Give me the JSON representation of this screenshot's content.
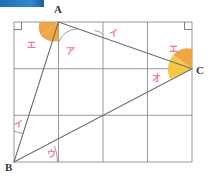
{
  "figure": {
    "type": "geometry-diagram",
    "canvas": {
      "width": 208,
      "height": 179,
      "background": "#ffffff"
    },
    "colors": {
      "grid_line": "#8c8c8c",
      "triangle_line": "#6e6e6e",
      "angle_fill_dark": "#eda13c",
      "angle_fill_light": "#f3c53f",
      "label_pink": "#f2788f",
      "point_label": "#3a3a3a",
      "accent_bar_start": "#1f6fb5",
      "accent_bar_end": "#2f86cf"
    },
    "rect": {
      "x0": 14,
      "y0": 22,
      "x1": 192,
      "y1": 162
    },
    "grid": {
      "columns": 4,
      "rows": 3,
      "x_lines": [
        14,
        58.5,
        103,
        147.5,
        192
      ],
      "y_lines": [
        22,
        68.7,
        115.3,
        162
      ]
    },
    "points": [
      {
        "name": "A",
        "x": 58.5,
        "y": 22,
        "label": "A",
        "label_x": 58,
        "label_y": 13
      },
      {
        "name": "B",
        "x": 14,
        "y": 162,
        "label": "B",
        "label_x": 4,
        "label_y": 171
      },
      {
        "name": "C",
        "x": 192,
        "y": 68.7,
        "label": "C",
        "label_x": 196,
        "label_y": 74
      }
    ],
    "segments": [
      {
        "name": "AB",
        "from": "A",
        "to": "B"
      },
      {
        "name": "AC",
        "from": "A",
        "to": "C"
      },
      {
        "name": "BC",
        "from": "B",
        "to": "C"
      }
    ],
    "angle_labels": [
      {
        "id": "a-e-left",
        "text": "エ",
        "x": 31,
        "y": 45
      },
      {
        "id": "a-a-right",
        "text": "ア",
        "x": 70,
        "y": 52
      },
      {
        "id": "top-i",
        "text": "イ",
        "x": 112,
        "y": 35
      },
      {
        "id": "c-e",
        "text": "エ",
        "x": 172,
        "y": 51
      },
      {
        "id": "c-o",
        "text": "オ",
        "x": 155,
        "y": 79
      },
      {
        "id": "b-i",
        "text": "イ",
        "x": 17,
        "y": 126
      },
      {
        "id": "b-u",
        "text": "ウ",
        "x": 50,
        "y": 155
      }
    ],
    "right_angle_marks": [
      {
        "id": "corner-top-left",
        "x": 14,
        "y": 22,
        "dir_x": 1,
        "dir_y": 1,
        "size": 7
      },
      {
        "id": "corner-top-right",
        "x": 192,
        "y": 22,
        "dir_x": -1,
        "dir_y": 1,
        "size": 7
      }
    ],
    "filled_angles": [
      {
        "id": "angle-A-e",
        "vertex": "A",
        "fill": "#eda13c"
      },
      {
        "id": "angle-C-e",
        "vertex": "C",
        "fill": "#eda13c"
      },
      {
        "id": "angle-C-o",
        "vertex": "C",
        "fill": "#f3c53f"
      }
    ],
    "thin_arcs": [
      {
        "id": "arc-A-a",
        "vertex": "A"
      },
      {
        "id": "arc-top-i",
        "vertex": "top-edge"
      },
      {
        "id": "arc-B-i",
        "vertex": "B"
      },
      {
        "id": "arc-B-u",
        "vertex": "B"
      }
    ]
  },
  "accent_bar": {
    "x": 0,
    "y": 0,
    "width": 44,
    "height": 7
  }
}
